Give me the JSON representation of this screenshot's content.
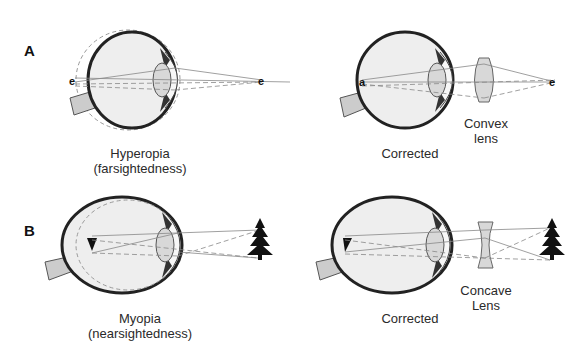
{
  "panels": {
    "A": {
      "letter": "A",
      "left": {
        "title_line1": "Hyperopia",
        "title_line2": "(farsightedness)",
        "object_glyph": "e",
        "image_glyph": "e"
      },
      "right": {
        "title": "Corrected",
        "lens_label_line1": "Convex",
        "lens_label_line2": "lens",
        "lens_type": "convex",
        "object_glyph": "e",
        "image_glyph": "e"
      }
    },
    "B": {
      "letter": "B",
      "left": {
        "title_line1": "Myopia",
        "title_line2": "(nearsightedness)",
        "object": "tree-icon",
        "image": "inverted-tree-icon"
      },
      "right": {
        "title": "Corrected",
        "lens_label_line1": "Concave",
        "lens_label_line2": "Lens",
        "lens_type": "concave",
        "object": "tree-icon",
        "image": "inverted-tree-icon"
      }
    }
  },
  "colors": {
    "outline": "#222222",
    "eye_fill": "#eeeeee",
    "lens_fill": "#d8d8d8",
    "ray": "#888888",
    "optic_nerve": "#cccccc"
  }
}
